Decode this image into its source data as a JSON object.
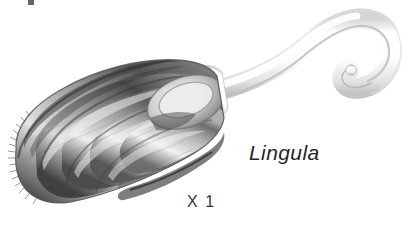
{
  "figure": {
    "kind": "scientific-illustration",
    "background_color": "#ffffff",
    "width": 413,
    "height": 228,
    "labels": {
      "taxon_name": "Lingula",
      "scale_marker": "X 1"
    },
    "palette": {
      "background": "#ffffff",
      "shell_dark": "#3c3c3c",
      "shell_mid": "#8a8a8a",
      "shell_light": "#d8d8d8",
      "shell_highlight": "#f2f2f2",
      "pedicle_light": "#fbfbfb",
      "pedicle_shade": "#cfcfcf",
      "outline": "#5a5a5a",
      "text": "#26262a"
    },
    "parts": [
      {
        "name": "shell-valve",
        "description": "tongue-shaped valve with concentric growth rings, shaded in graphite greys"
      },
      {
        "name": "growth-rings",
        "description": "nested concentric ridges running parallel to the shell margin",
        "count": 6
      },
      {
        "name": "umbo",
        "description": "beak region at the narrow posterior end adjoining the pedicle"
      },
      {
        "name": "shell-margin-fringe",
        "description": "fine bristle-like setae along the anterior left margin"
      },
      {
        "name": "pedicle",
        "description": "long pale fleshy stalk curving up and to the right, hooking back on itself"
      }
    ]
  }
}
